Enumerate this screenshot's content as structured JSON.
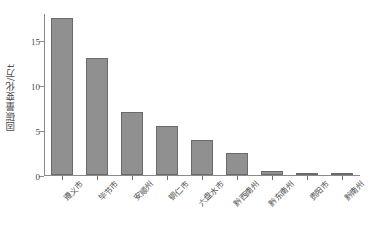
{
  "chart_data": {
    "type": "bar",
    "title": "",
    "subtitle": "",
    "xlabel": "",
    "ylabel": "固碳量变化/万t",
    "categories": [
      "遵义市",
      "毕节市",
      "安顺州",
      "铜仁市",
      "六盘水市",
      "黔西南州",
      "黔东南州",
      "贵阳市",
      "黔南州"
    ],
    "values": [
      17.4,
      13.0,
      7.0,
      5.5,
      3.9,
      2.4,
      0.5,
      0.1,
      0.05
    ],
    "ylim": [
      0,
      18
    ],
    "yticks": [
      0,
      5,
      10,
      15
    ],
    "ytick_labels": [
      "0",
      "5",
      "10",
      "15"
    ],
    "grid": false,
    "legend": false,
    "legend_position": "none",
    "bar_color": "#909090",
    "bar_edge_color": "#6a6a6a",
    "axis_color": "#8a8a8a",
    "text_color": "#4a4a4a",
    "background": "#ffffff",
    "xtick_label_rotation": -45
  }
}
